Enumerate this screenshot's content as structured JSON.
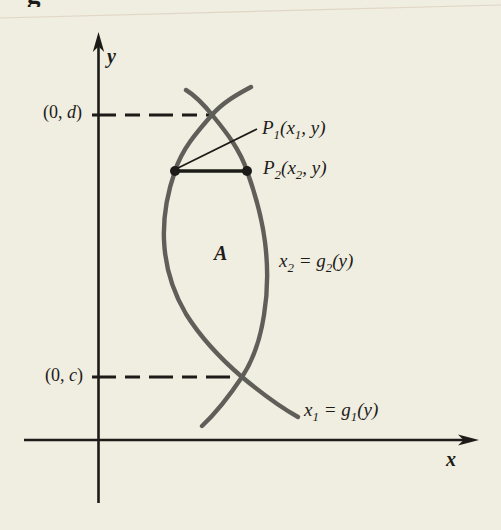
{
  "figure": {
    "type": "math-diagram",
    "colors": {
      "background": "#f0ede1",
      "ink": "#1d1b18",
      "curve": "#5f5e59"
    },
    "caption_fragment": "g",
    "axes": {
      "x_label": "x",
      "y_label": "y"
    },
    "region_label": "A",
    "point_labels": {
      "p1": {
        "parts": [
          "P",
          "1",
          "(x",
          "1",
          ", y)"
        ]
      },
      "p2": {
        "parts": [
          "P",
          "2",
          "(x",
          "2",
          ", y)"
        ]
      }
    },
    "curve_labels": {
      "g2": {
        "parts": [
          "x",
          "2",
          " = g",
          "2",
          "(y)"
        ]
      },
      "g1": {
        "parts": [
          "x",
          "1",
          " = g",
          "1",
          "(y)"
        ]
      }
    },
    "intercept_labels": {
      "d": {
        "pre": "(0, ",
        "var": "d",
        "post": ")"
      },
      "c": {
        "pre": "(0, ",
        "var": "c",
        "post": ")"
      }
    }
  }
}
